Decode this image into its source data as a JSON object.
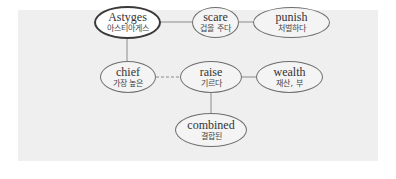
{
  "diagram": {
    "nodes": [
      {
        "id": "astyges",
        "en": "Astyges",
        "ko": "아스티아게스",
        "root": true
      },
      {
        "id": "scare",
        "en": "scare",
        "ko": "겁을 주다"
      },
      {
        "id": "punish",
        "en": "punish",
        "ko": "처벌하다"
      },
      {
        "id": "chief",
        "en": "chief",
        "ko": "가장 높은"
      },
      {
        "id": "raise",
        "en": "raise",
        "ko": "기르다"
      },
      {
        "id": "wealth",
        "en": "wealth",
        "ko": "재산, 부"
      },
      {
        "id": "combined",
        "en": "combined",
        "ko": "결합된"
      }
    ],
    "edges": [
      {
        "from": "astyges",
        "to": "scare",
        "style": "solid"
      },
      {
        "from": "scare",
        "to": "punish",
        "style": "solid"
      },
      {
        "from": "astyges",
        "to": "chief",
        "style": "solid"
      },
      {
        "from": "chief",
        "to": "raise",
        "style": "dashed"
      },
      {
        "from": "raise",
        "to": "wealth",
        "style": "solid"
      },
      {
        "from": "raise",
        "to": "combined",
        "style": "solid"
      }
    ],
    "colors": {
      "panel_bg": "#efefef",
      "node_border": "#6e6e6e",
      "root_border": "#3a3a3a",
      "edge": "#8a8a8a"
    }
  }
}
